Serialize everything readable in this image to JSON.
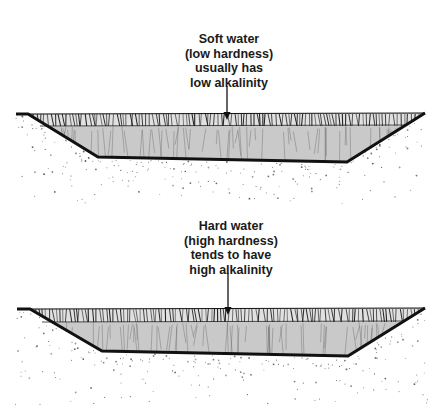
{
  "diagram": {
    "title": "",
    "panels": [
      {
        "id": "soft-water",
        "caption_lines": [
          "Soft water",
          "(low hardness)",
          "usually has",
          "low alkalinity"
        ],
        "label": "soft-water-pond"
      },
      {
        "id": "hard-water",
        "caption_lines": [
          "Hard water",
          "(high hardness)",
          "tends to have",
          "high alkalinity"
        ],
        "label": "hard-water-pond"
      }
    ],
    "colors": {
      "water": "#c9c9c9",
      "outline": "#111111",
      "soil_speckle": "#555555",
      "background": "#ffffff",
      "text": "#1a1a1a"
    }
  }
}
